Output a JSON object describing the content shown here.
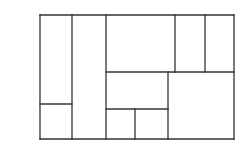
{
  "diagram": {
    "type": "rectangle-partition",
    "stroke_color": "#333333",
    "background": "#ffffff",
    "stroke_width": 1.3,
    "outer": {
      "x": 40,
      "y": 15,
      "w": 194,
      "h": 124
    },
    "lines": [
      {
        "id": "outer-top",
        "x1": 40,
        "y1": 15,
        "x2": 234,
        "y2": 15
      },
      {
        "id": "outer-bottom",
        "x1": 40,
        "y1": 139,
        "x2": 234,
        "y2": 139
      },
      {
        "id": "outer-left",
        "x1": 40,
        "y1": 15,
        "x2": 40,
        "y2": 139
      },
      {
        "id": "outer-right",
        "x1": 234,
        "y1": 15,
        "x2": 234,
        "y2": 139
      },
      {
        "id": "v-72",
        "x1": 72,
        "y1": 15,
        "x2": 72,
        "y2": 139
      },
      {
        "id": "v-106",
        "x1": 106,
        "y1": 15,
        "x2": 106,
        "y2": 139
      },
      {
        "id": "h-104-left",
        "x1": 40,
        "y1": 104,
        "x2": 72,
        "y2": 104
      },
      {
        "id": "h-72-right",
        "x1": 106,
        "y1": 72,
        "x2": 234,
        "y2": 72
      },
      {
        "id": "v-175-top",
        "x1": 175,
        "y1": 15,
        "x2": 175,
        "y2": 72
      },
      {
        "id": "v-205-top",
        "x1": 205,
        "y1": 15,
        "x2": 205,
        "y2": 72
      },
      {
        "id": "v-168-lower",
        "x1": 168,
        "y1": 72,
        "x2": 168,
        "y2": 139
      },
      {
        "id": "h-109-mid",
        "x1": 106,
        "y1": 109,
        "x2": 168,
        "y2": 109
      },
      {
        "id": "v-135-bottom",
        "x1": 135,
        "y1": 109,
        "x2": 135,
        "y2": 139
      }
    ],
    "cells": [
      {
        "name": "cell-left-tall",
        "x": 40,
        "y": 15,
        "w": 32,
        "h": 89
      },
      {
        "name": "cell-left-small",
        "x": 40,
        "y": 104,
        "w": 32,
        "h": 35
      },
      {
        "name": "cell-second-column",
        "x": 72,
        "y": 15,
        "w": 34,
        "h": 124
      },
      {
        "name": "cell-top-wide",
        "x": 106,
        "y": 15,
        "w": 69,
        "h": 57
      },
      {
        "name": "cell-top-narrow-1",
        "x": 175,
        "y": 15,
        "w": 30,
        "h": 57
      },
      {
        "name": "cell-top-narrow-2",
        "x": 205,
        "y": 15,
        "w": 29,
        "h": 57
      },
      {
        "name": "cell-middle",
        "x": 106,
        "y": 72,
        "w": 62,
        "h": 37
      },
      {
        "name": "cell-bottom-small-1",
        "x": 106,
        "y": 109,
        "w": 29,
        "h": 30
      },
      {
        "name": "cell-bottom-small-2",
        "x": 135,
        "y": 109,
        "w": 33,
        "h": 30
      },
      {
        "name": "cell-bottom-right-square",
        "x": 168,
        "y": 72,
        "w": 66,
        "h": 67
      }
    ]
  }
}
